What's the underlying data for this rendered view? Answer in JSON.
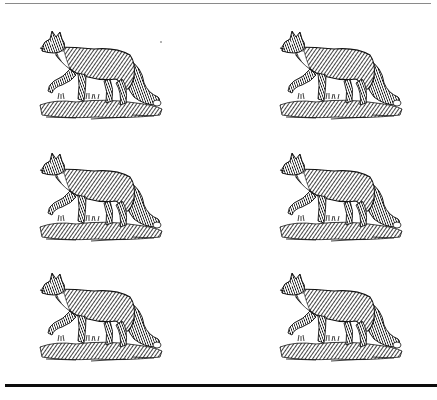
{
  "page": {
    "background": "#ffffff",
    "ink_color": "#111111"
  },
  "rules": {
    "top": {
      "color": "#8a8a8a",
      "thickness_px": 1
    },
    "bottom": {
      "color": "#0c0c0c",
      "thickness_px": 3
    }
  },
  "grid": {
    "columns": 2,
    "rows": 3,
    "illustrations": [
      {
        "subject": "fox-woodcut",
        "row": 1,
        "col": 1
      },
      {
        "subject": "fox-woodcut",
        "row": 1,
        "col": 2
      },
      {
        "subject": "fox-woodcut",
        "row": 2,
        "col": 1
      },
      {
        "subject": "fox-woodcut",
        "row": 2,
        "col": 2
      },
      {
        "subject": "fox-woodcut",
        "row": 3,
        "col": 1
      },
      {
        "subject": "fox-woodcut",
        "row": 3,
        "col": 2
      }
    ]
  }
}
